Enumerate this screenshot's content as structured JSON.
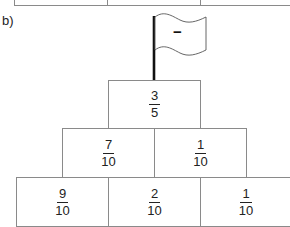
{
  "part_label": "b)",
  "flag": {
    "sign": "−",
    "icon": "flag-icon"
  },
  "pyramid": {
    "rows": [
      {
        "cells": [
          {
            "numerator": "3",
            "denominator": "5"
          }
        ]
      },
      {
        "cells": [
          {
            "numerator": "7",
            "denominator": "10"
          },
          {
            "numerator": "1",
            "denominator": "10"
          }
        ]
      },
      {
        "cells": [
          {
            "numerator": "9",
            "denominator": "10"
          },
          {
            "numerator": "2",
            "denominator": "10"
          },
          {
            "numerator": "1",
            "denominator": "10"
          }
        ]
      }
    ]
  }
}
